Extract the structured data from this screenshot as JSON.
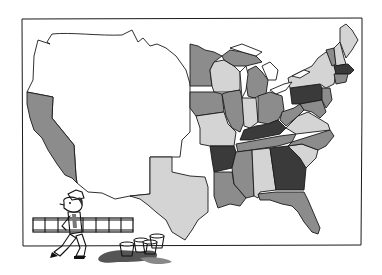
{
  "illustration": {
    "subject": "Map of the United States with states shaded in four gray tones, and a cartoon painter carrying a ladder past spilled paint buckets",
    "frame": {
      "stroke": "#1a1a1a",
      "background": "#ffffff"
    },
    "palette": {
      "unshaded": "#ffffff",
      "light": "#d4d4d4",
      "medium": "#8c8c8c",
      "dark": "#3a3a3a",
      "ink": "#1a1a1a"
    },
    "regions": {
      "west_unshaded": "unshaded",
      "california": "medium",
      "texas": "light",
      "minnesota": "medium",
      "wisconsin": "light",
      "michigan_upper": "medium",
      "michigan_lower": "medium",
      "iowa": "medium",
      "illinois": "medium",
      "indiana": "light",
      "ohio": "medium",
      "missouri": "light",
      "kentucky": "dark",
      "tennessee": "medium",
      "arkansas": "dark",
      "louisiana": "medium",
      "mississippi": "medium",
      "alabama": "light",
      "georgia": "dark",
      "florida": "medium",
      "south_carolina": "light",
      "north_carolina": "medium",
      "virginia": "light",
      "west_virginia": "medium",
      "pennsylvania": "dark",
      "new_york": "light",
      "new_jersey": "medium",
      "maryland_delaware": "medium",
      "vermont": "medium",
      "new_hampshire": "light",
      "maine": "light",
      "massachusetts": "dark",
      "connecticut_ri": "medium"
    },
    "figure": {
      "character": "painter",
      "carrying": "ladder",
      "paint_buckets": 4,
      "spill": true
    }
  }
}
